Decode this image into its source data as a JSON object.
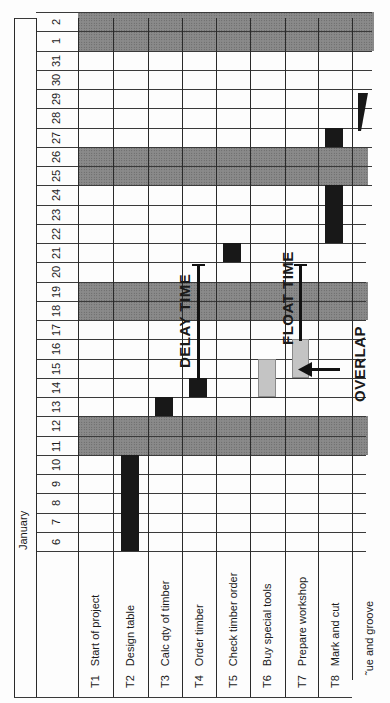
{
  "chart_data": {
    "type": "gantt",
    "orientation": "rotated-90-ccw",
    "title": "January",
    "days": [
      6,
      7,
      8,
      9,
      10,
      11,
      12,
      13,
      14,
      15,
      16,
      17,
      18,
      19,
      20,
      21,
      22,
      23,
      24,
      25,
      26,
      27,
      28,
      29,
      30,
      31,
      1,
      2
    ],
    "weekend_days": [
      11,
      12,
      18,
      19,
      25,
      26,
      1,
      2
    ],
    "tasks": [
      {
        "id": "T1",
        "name": "Start of project",
        "bars": []
      },
      {
        "id": "T2",
        "name": "Design table",
        "bars": [
          {
            "start": 6,
            "end": 10,
            "style": "dark"
          }
        ]
      },
      {
        "id": "T3",
        "name": "Calc qty of timber",
        "bars": [
          {
            "start": 13,
            "end": 13,
            "style": "dark"
          }
        ]
      },
      {
        "id": "T4",
        "name": "Order timber",
        "bars": [
          {
            "start": 14,
            "end": 14,
            "style": "dark"
          }
        ]
      },
      {
        "id": "T5",
        "name": "Check timber order",
        "bars": [
          {
            "start": 21,
            "end": 21,
            "style": "dark"
          }
        ]
      },
      {
        "id": "T6",
        "name": "Buy special tools",
        "bars": [
          {
            "start": 14,
            "end": 15,
            "style": "light"
          }
        ]
      },
      {
        "id": "T7",
        "name": "Prepare workshop",
        "bars": [
          {
            "start": 15,
            "end": 16,
            "style": "light"
          }
        ]
      },
      {
        "id": "T8",
        "name": "Mark and cut",
        "bars": [
          {
            "start": 22,
            "end": 24,
            "style": "dark"
          },
          {
            "start": 27,
            "end": 27,
            "style": "dark"
          }
        ]
      },
      {
        "id": "T9",
        "name": "...ue and groove",
        "bars": [
          {
            "start": 28,
            "end": 28,
            "style": "dark-partial"
          }
        ]
      }
    ],
    "annotations": [
      {
        "label": "DELAY TIME",
        "task": "T4",
        "from_day": 15,
        "to_day": 20
      },
      {
        "label": "FLOAT TIME",
        "task": "T7",
        "from_day": 17,
        "to_day": 20
      },
      {
        "label": "OVERLAP",
        "task": "T7",
        "arrow": "points to overlap between T6 and T7"
      }
    ]
  },
  "header": {
    "month": "January"
  },
  "days": [
    "6",
    "7",
    "8",
    "9",
    "10",
    "11",
    "12",
    "13",
    "14",
    "15",
    "16",
    "17",
    "18",
    "19",
    "20",
    "21",
    "22",
    "23",
    "24",
    "25",
    "26",
    "27",
    "28",
    "29",
    "30",
    "31",
    "1",
    "2"
  ],
  "tasks": [
    {
      "id": "T1",
      "name": "Start of project"
    },
    {
      "id": "T2",
      "name": "Design table"
    },
    {
      "id": "T3",
      "name": "Calc qty of timber"
    },
    {
      "id": "T4",
      "name": "Order timber"
    },
    {
      "id": "T5",
      "name": "Check timber order"
    },
    {
      "id": "T6",
      "name": "Buy special tools"
    },
    {
      "id": "T7",
      "name": "Prepare workshop"
    },
    {
      "id": "T8",
      "name": "Mark and cut"
    },
    {
      "id": "T9",
      "name": "˜ue and groove"
    }
  ],
  "annotations": {
    "delay": "DELAY TIME",
    "float": "FLOAT TIME",
    "overlap": "OVERLAP"
  }
}
